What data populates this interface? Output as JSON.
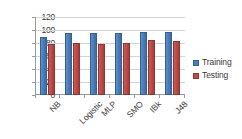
{
  "chart_data": {
    "type": "bar",
    "title": "",
    "xlabel": "",
    "ylabel": "",
    "categories": [
      "NB",
      "Logistic",
      "MLP",
      "SMO",
      "IBk",
      "J48"
    ],
    "series": [
      {
        "name": "Training",
        "color": "#4A7EBB",
        "values": [
          90,
          95,
          96,
          95.5,
          97,
          97
        ]
      },
      {
        "name": "Testing",
        "color": "#BE4B48",
        "values": [
          78,
          80.5,
          78.5,
          80,
          85,
          83
        ]
      }
    ],
    "ylim": [
      0,
      120
    ],
    "ytick_step": 20,
    "yticks": [
      120,
      100,
      80,
      60,
      40,
      20,
      0
    ],
    "ytick_labels": [
      "120",
      "100",
      "80",
      "60",
      "40",
      "20",
      "0"
    ],
    "grid": true,
    "legend_position": "right"
  },
  "legend": {
    "items": [
      {
        "label": "Training"
      },
      {
        "label": "Testing"
      }
    ]
  }
}
